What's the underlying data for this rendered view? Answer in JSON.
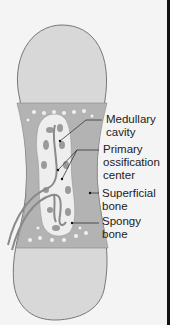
{
  "diagram": {
    "colors": {
      "background": "#f4f4f4",
      "epiphysis": "#d8d8d8",
      "shaft": "#b3b3b3",
      "cavity": "#eeeeee",
      "vessel": "#8a8a8a",
      "outline": "#777777",
      "leader_line": "#333333",
      "label_text": "#222222"
    },
    "labels": [
      {
        "id": "medullary-cavity",
        "text": "Medullary\ncavity"
      },
      {
        "id": "primary-ossification-center",
        "text": "Primary\nossification\ncenter"
      },
      {
        "id": "superficial-bone",
        "text": "Superficial\nbone"
      },
      {
        "id": "spongy-bone",
        "text": "Spongy\nbone"
      }
    ]
  }
}
